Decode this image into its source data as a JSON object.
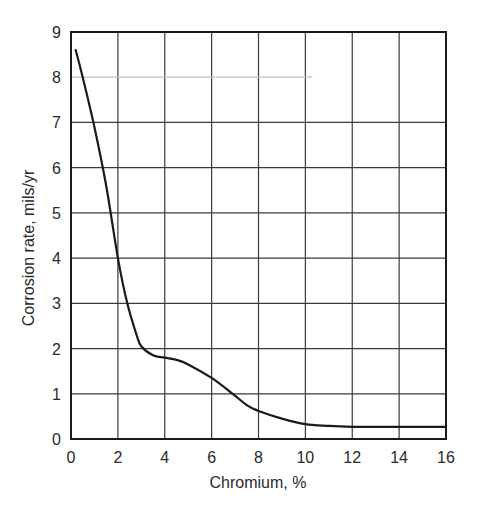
{
  "chart_data": {
    "type": "line",
    "title": "",
    "xlabel": "Chromium, %",
    "ylabel": "Corrosion rate, mils/yr",
    "xlim": [
      0,
      16
    ],
    "ylim": [
      0,
      9
    ],
    "grid": true,
    "legend": null,
    "x_ticks": [
      0,
      2,
      4,
      6,
      8,
      10,
      12,
      14,
      16
    ],
    "y_ticks": [
      0,
      1,
      2,
      3,
      4,
      5,
      6,
      7,
      8,
      9
    ],
    "series": [
      {
        "name": "Corrosion rate",
        "color": "#1a1a1a",
        "x": [
          0.2,
          0.5,
          1.0,
          1.5,
          2.0,
          2.4,
          2.8,
          3.0,
          3.5,
          4.0,
          4.5,
          5.0,
          6.0,
          6.9,
          7.5,
          8.0,
          9.0,
          10.0,
          11.0,
          12.0,
          13.0,
          14.0,
          15.0,
          16.0
        ],
        "y": [
          8.6,
          8.0,
          6.9,
          5.6,
          4.0,
          3.0,
          2.3,
          2.05,
          1.85,
          1.8,
          1.75,
          1.65,
          1.35,
          1.0,
          0.75,
          0.62,
          0.45,
          0.33,
          0.29,
          0.27,
          0.27,
          0.27,
          0.27,
          0.27
        ]
      }
    ],
    "annotations": [
      {
        "type": "faded_gridline",
        "y": 8,
        "x_end": 10.3,
        "note": "y=8 gridline appears faint and stops near x=10"
      }
    ]
  },
  "colors": {
    "axis": "#1a1a1a",
    "grid": "#3a3a3a",
    "curve": "#1a1a1a",
    "faint_grid": "#bdbdbd",
    "background": "#ffffff"
  }
}
